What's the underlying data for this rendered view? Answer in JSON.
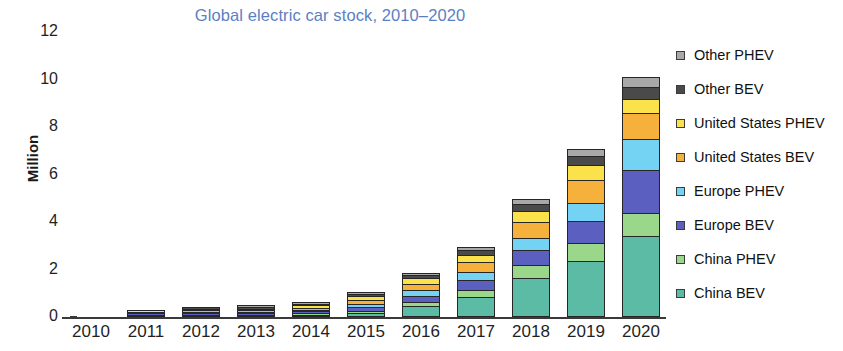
{
  "chart_data": {
    "type": "bar",
    "stacked": true,
    "title": "Global electric car stock, 2010–2020",
    "title_color": "#5b7fc4",
    "xlabel": "",
    "ylabel": "Million",
    "categories": [
      "2010",
      "2011",
      "2012",
      "2013",
      "2014",
      "2015",
      "2016",
      "2017",
      "2018",
      "2019",
      "2020"
    ],
    "ylim": [
      0,
      12
    ],
    "yticks": [
      0,
      2,
      4,
      6,
      8,
      10,
      12
    ],
    "ytick_labels": [
      "0",
      "2",
      "4",
      "6",
      "8",
      "10",
      "12"
    ],
    "grid": false,
    "legend_position": "right",
    "series": [
      {
        "name": "China BEV",
        "color": "#5cbba4",
        "values": [
          0.0,
          0.01,
          0.01,
          0.02,
          0.06,
          0.19,
          0.45,
          0.85,
          1.65,
          2.35,
          3.4
        ]
      },
      {
        "name": "China PHEV",
        "color": "#9bd78b",
        "values": [
          0.0,
          0.0,
          0.0,
          0.0,
          0.02,
          0.07,
          0.17,
          0.3,
          0.55,
          0.75,
          1.0
        ]
      },
      {
        "name": "Europe BEV",
        "color": "#5b5fc0",
        "values": [
          0.0,
          0.01,
          0.02,
          0.04,
          0.09,
          0.17,
          0.28,
          0.42,
          0.62,
          0.95,
          1.8
        ]
      },
      {
        "name": "Europe PHEV",
        "color": "#74d2f3",
        "values": [
          0.0,
          0.0,
          0.01,
          0.02,
          0.06,
          0.13,
          0.22,
          0.34,
          0.5,
          0.75,
          1.3
        ]
      },
      {
        "name": "United States BEV",
        "color": "#f6b03c",
        "values": [
          0.0,
          0.01,
          0.02,
          0.05,
          0.09,
          0.17,
          0.28,
          0.4,
          0.66,
          0.98,
          1.1
        ]
      },
      {
        "name": "United States PHEV",
        "color": "#fbe24a",
        "values": [
          0.0,
          0.01,
          0.02,
          0.05,
          0.09,
          0.16,
          0.23,
          0.32,
          0.5,
          0.6,
          0.6
        ]
      },
      {
        "name": "Other BEV",
        "color": "#4a4a4a",
        "values": [
          0.0,
          0.0,
          0.01,
          0.02,
          0.04,
          0.08,
          0.14,
          0.2,
          0.28,
          0.38,
          0.5
        ]
      },
      {
        "name": "Other PHEV",
        "color": "#a8a8a8",
        "values": [
          0.0,
          0.0,
          0.0,
          0.01,
          0.02,
          0.04,
          0.08,
          0.14,
          0.22,
          0.3,
          0.4
        ]
      }
    ],
    "legend_order_top_to_bottom": [
      "Other PHEV",
      "Other BEV",
      "United States PHEV",
      "United States BEV",
      "Europe PHEV",
      "Europe BEV",
      "China PHEV",
      "China BEV"
    ]
  }
}
